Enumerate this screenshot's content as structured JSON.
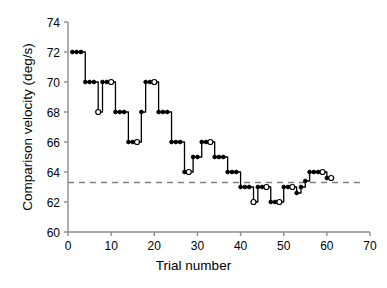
{
  "chart_data": {
    "type": "line",
    "title": "",
    "subtitle": "",
    "xlabel": "Trial number",
    "ylabel": "Comparison velocity (deg/s)",
    "xlim": [
      0,
      70
    ],
    "ylim": [
      60,
      74
    ],
    "xticks": [
      0,
      10,
      20,
      30,
      40,
      50,
      60,
      70
    ],
    "yticks": [
      60,
      62,
      64,
      66,
      68,
      70,
      72,
      74
    ],
    "grid": false,
    "legend": null,
    "annotations": [
      {
        "name": "threshold-reference-line",
        "type": "horizontal-dashed-line",
        "value": 63.3,
        "color": "#808080",
        "style": "dashed"
      }
    ],
    "series": [
      {
        "name": "staircase",
        "line_color": "#000000",
        "marker_filled_color": "#000000",
        "marker_open_color": "#ffffff",
        "x": [
          1,
          2,
          3,
          4,
          5,
          6,
          7,
          8,
          9,
          10,
          11,
          12,
          13,
          14,
          15,
          16,
          17,
          18,
          19,
          20,
          21,
          22,
          23,
          24,
          25,
          26,
          27,
          28,
          29,
          30,
          31,
          32,
          33,
          34,
          35,
          36,
          37,
          38,
          39,
          40,
          41,
          42,
          43,
          44,
          45,
          46,
          47,
          48,
          49,
          50,
          51,
          52,
          53,
          54,
          55,
          56,
          57,
          58,
          59,
          60,
          61
        ],
        "values": [
          72,
          72,
          72,
          70,
          70,
          70,
          68,
          70,
          70,
          70,
          68,
          68,
          68,
          66,
          66,
          66,
          68,
          70,
          70,
          70,
          68,
          68,
          68,
          66,
          66,
          66,
          64,
          64,
          65,
          65,
          66,
          66,
          66,
          65,
          65,
          65,
          64,
          64,
          64,
          63,
          63,
          63,
          62,
          63,
          63,
          63,
          62,
          62,
          62,
          63,
          63,
          63,
          62.6,
          63,
          63.4,
          64,
          64,
          64,
          64,
          63.6,
          63.6
        ],
        "marker_types": [
          "filled",
          "filled",
          "filled",
          "filled",
          "filled",
          "filled",
          "open",
          "filled",
          "filled",
          "open",
          "filled",
          "filled",
          "filled",
          "filled",
          "filled",
          "open",
          "filled",
          "filled",
          "filled",
          "open",
          "filled",
          "filled",
          "filled",
          "filled",
          "filled",
          "filled",
          "filled",
          "open",
          "filled",
          "filled",
          "filled",
          "filled",
          "open",
          "filled",
          "filled",
          "filled",
          "filled",
          "filled",
          "filled",
          "filled",
          "filled",
          "filled",
          "open",
          "filled",
          "filled",
          "open",
          "filled",
          "filled",
          "open",
          "filled",
          "filled",
          "open",
          "filled",
          "filled",
          "filled",
          "filled",
          "filled",
          "filled",
          "open",
          "filled",
          "open"
        ]
      }
    ]
  },
  "axis": {
    "x_tick_labels": [
      "0",
      "10",
      "20",
      "30",
      "40",
      "50",
      "60",
      "70"
    ],
    "y_tick_labels": [
      "60",
      "62",
      "64",
      "66",
      "68",
      "70",
      "72",
      "74"
    ],
    "x_axis_title": "Trial number",
    "y_axis_title": "Comparison velocity (deg/s)"
  },
  "colors": {
    "line": "#000000",
    "axis": "#808080",
    "reference": "#9a9a9a",
    "background": "#ffffff"
  }
}
